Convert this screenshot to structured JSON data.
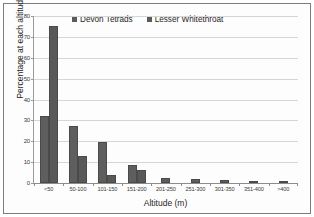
{
  "chart_data": {
    "type": "bar",
    "title": "",
    "xlabel": "Altitude (m)",
    "ylabel": "Percentage at each altitude",
    "categories": [
      "<50",
      "50-100",
      "101-150",
      "151-200",
      "201-250",
      "251-300",
      "301-350",
      "351-400",
      ">400"
    ],
    "series": [
      {
        "name": "Devon Tetrads",
        "color": "#5e5e5e",
        "values": [
          32,
          27.3,
          19.5,
          8.6,
          2.2,
          2.1,
          1.3,
          0.9,
          0.5
        ]
      },
      {
        "name": "Lesser Whitethroat",
        "color": "#595959",
        "values": [
          75.3,
          13,
          4,
          6,
          0,
          0,
          0,
          0,
          0
        ]
      }
    ],
    "ylim": [
      0,
      80
    ],
    "yticks": [
      0,
      10,
      20,
      30,
      40,
      50,
      60,
      70,
      80
    ],
    "ytick_labels": [
      "0",
      "10",
      "20",
      "30",
      "40",
      "50",
      "60",
      "70",
      "80"
    ],
    "grid": true,
    "legend_position": "top-center"
  },
  "legend": {
    "items": [
      {
        "label": "Devon Tetrads"
      },
      {
        "label": "Lesser Whitethroat"
      }
    ]
  }
}
